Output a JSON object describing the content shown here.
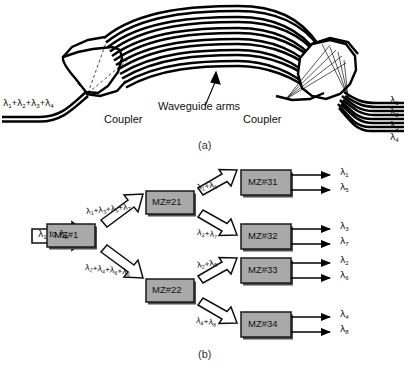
{
  "figure": {
    "panel_a": {
      "caption": "(a)",
      "input_label": "λ1+λ2+λ3+λ4",
      "annotation": "Waveguide arms",
      "coupler_left_label": "Coupler",
      "coupler_right_label": "Coupler",
      "outputs": [
        "λ1",
        "λ2",
        "λ3",
        "λ4"
      ],
      "arm_count": 7,
      "description": "Arrayed waveguide grating demultiplexer"
    },
    "panel_b": {
      "caption": "(b)",
      "input_label": "λ1 to λ8",
      "stage1": {
        "box": "MZ#1",
        "upper_branch": "λ1+λ3+λ5+λ7",
        "lower_branch": "λ2+λ4+λ6+λ8"
      },
      "stage2": [
        {
          "box": "MZ#21",
          "upper_branch": "λ1+λ5",
          "lower_branch": "λ3+λ7"
        },
        {
          "box": "MZ#22",
          "upper_branch": "λ2+λ6",
          "lower_branch": "λ4+λ8"
        }
      ],
      "stage3": [
        {
          "box": "MZ#31",
          "outputs": [
            "λ1",
            "λ5"
          ]
        },
        {
          "box": "MZ#32",
          "outputs": [
            "λ3",
            "λ7"
          ]
        },
        {
          "box": "MZ#33",
          "outputs": [
            "λ2",
            "λ6"
          ]
        },
        {
          "box": "MZ#34",
          "outputs": [
            "λ4",
            "λ8"
          ]
        }
      ]
    }
  },
  "colors": {
    "box_fill": "#a9a9a9",
    "box_stroke": "#1a1a1a",
    "shadow": "#4d4d4d",
    "line": "#000000",
    "background": "#ffffff"
  }
}
